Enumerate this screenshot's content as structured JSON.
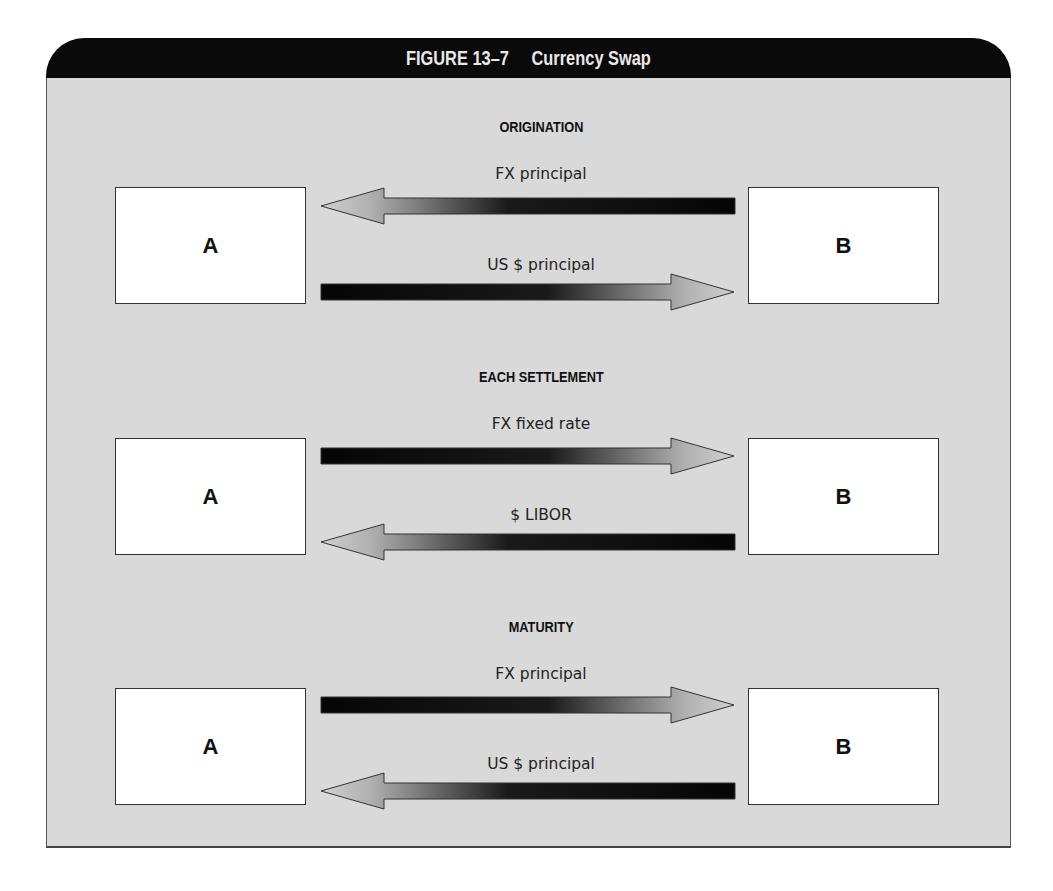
{
  "figure": {
    "number": "FIGURE 13–7",
    "title": "Currency Swap"
  },
  "colors": {
    "header_bg": "#0a0a0a",
    "header_text": "#e8e8e8",
    "panel_bg": "#d9d9d9",
    "box_bg": "#ffffff",
    "arrow_dark": "#0a0a0a",
    "arrow_light": "#c8c8c8"
  },
  "sections": [
    {
      "title": "ORIGINATION",
      "left_party": "A",
      "right_party": "B",
      "flows": [
        {
          "label": "FX principal",
          "direction": "B→A"
        },
        {
          "label": "US $ principal",
          "direction": "A→B"
        }
      ]
    },
    {
      "title": "EACH SETTLEMENT",
      "left_party": "A",
      "right_party": "B",
      "flows": [
        {
          "label": "FX fixed rate",
          "direction": "A→B"
        },
        {
          "label": "$ LIBOR",
          "direction": "B→A"
        }
      ]
    },
    {
      "title": "MATURITY",
      "left_party": "A",
      "right_party": "B",
      "flows": [
        {
          "label": "FX principal",
          "direction": "A→B"
        },
        {
          "label": "US $ principal",
          "direction": "B→A"
        }
      ]
    }
  ]
}
